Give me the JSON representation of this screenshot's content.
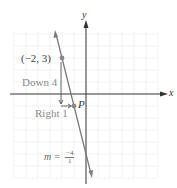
{
  "graph": {
    "axes": {
      "x_label": "x",
      "y_label": "y"
    },
    "grid": {
      "x_range": [
        -6,
        6
      ],
      "y_range": [
        -7,
        5
      ],
      "unit_px": 12,
      "origin_px": [
        86,
        94
      ]
    },
    "points": [
      {
        "label": "(−2, 3)",
        "x": -2,
        "y": 3
      },
      {
        "label": "P",
        "x": -1,
        "y": -1
      }
    ],
    "annotations": {
      "down": "Down 4",
      "right": "Right 1",
      "slope_prefix": "m =",
      "slope_numerator": "−4",
      "slope_denominator": "1"
    },
    "colors": {
      "line": "#7a7a7a",
      "grid": "#d8d8d8",
      "axis": "#333333",
      "point": "#888888"
    }
  }
}
